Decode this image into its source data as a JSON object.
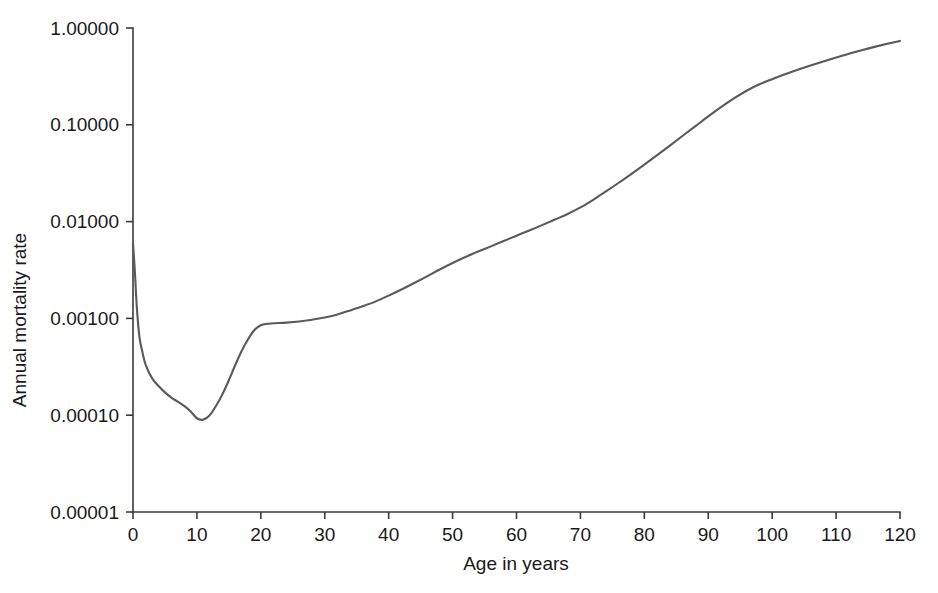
{
  "chart_data": {
    "type": "line",
    "title": "",
    "subtitle": "",
    "xlabel": "Age in years",
    "ylabel": "Annual mortality rate",
    "yscale": "log",
    "xscale": "linear",
    "xlim": [
      0,
      120
    ],
    "ylim": [
      1e-05,
      1.0
    ],
    "grid": false,
    "legend": null,
    "line_color": "#5a5a5a",
    "axis_color": "#3a3a3a",
    "x_ticks": [
      0,
      10,
      20,
      30,
      40,
      50,
      60,
      70,
      80,
      90,
      100,
      110,
      120
    ],
    "x_tick_labels": [
      "0",
      "10",
      "20",
      "30",
      "40",
      "50",
      "60",
      "70",
      "80",
      "90",
      "100",
      "110",
      "120"
    ],
    "y_ticks": [
      1.0,
      0.1,
      0.01,
      0.001,
      0.0001,
      1e-05
    ],
    "y_tick_labels": [
      "1.00000",
      "0.10000",
      "0.01000",
      "0.00100",
      "0.00010",
      "0.00001"
    ],
    "series": [
      {
        "name": "Annual mortality rate",
        "x": [
          0,
          0.3,
          0.6,
          1,
          1.5,
          2,
          3,
          4,
          5,
          6,
          7,
          8,
          9,
          10,
          11,
          12,
          13,
          14,
          15,
          16,
          17,
          18,
          19,
          20,
          21,
          22,
          24,
          26,
          28,
          30,
          32,
          34,
          36,
          38,
          40,
          42,
          44,
          46,
          48,
          50,
          52,
          54,
          56,
          58,
          60,
          62,
          64,
          66,
          68,
          70,
          72,
          74,
          76,
          78,
          80,
          82,
          84,
          86,
          88,
          90,
          92,
          94,
          96,
          98,
          100,
          102,
          104,
          106,
          108,
          110,
          112,
          114,
          116,
          118,
          120
        ],
        "y": [
          0.006,
          0.003,
          0.0013,
          0.00065,
          0.00044,
          0.00033,
          0.00024,
          0.0002,
          0.000172,
          0.000152,
          0.000138,
          0.000125,
          0.00011,
          9.3e-05,
          9e-05,
          0.0001,
          0.000125,
          0.000165,
          0.00023,
          0.00033,
          0.00046,
          0.00061,
          0.00076,
          0.00085,
          0.00088,
          0.00089,
          0.000905,
          0.00093,
          0.00097,
          0.00102,
          0.0011,
          0.00121,
          0.00134,
          0.0015,
          0.00172,
          0.00199,
          0.00232,
          0.00272,
          0.0032,
          0.00373,
          0.0043,
          0.0049,
          0.00555,
          0.0063,
          0.00715,
          0.0081,
          0.0092,
          0.0105,
          0.012,
          0.014,
          0.0168,
          0.0205,
          0.0252,
          0.0312,
          0.0388,
          0.0485,
          0.061,
          0.077,
          0.097,
          0.122,
          0.152,
          0.187,
          0.225,
          0.262,
          0.296,
          0.332,
          0.37,
          0.41,
          0.452,
          0.496,
          0.542,
          0.59,
          0.638,
          0.686,
          0.735
        ]
      }
    ]
  },
  "axes": {
    "y_axis_title": "Annual mortality rate",
    "x_axis_title": "Age in years"
  }
}
